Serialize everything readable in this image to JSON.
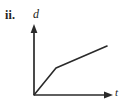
{
  "figure": {
    "item_number": "ii.",
    "background_color": "#ffffff",
    "stroke_color": "#2a2a2a",
    "width": 125,
    "height": 107
  },
  "chart_data": {
    "type": "line",
    "title": "",
    "subtitle": "",
    "xlabel": "t",
    "ylabel": "d",
    "xlabel_full": "time",
    "ylabel_full": "distance",
    "axes_style": "arrow-headed, no tick marks, no numeric scale",
    "grid": false,
    "legend": null,
    "xlim": [
      0,
      1
    ],
    "ylim": [
      0,
      1
    ],
    "tick_labels_x": [],
    "tick_labels_y": [],
    "annotations": [],
    "series": [
      {
        "name": "distance",
        "description": "piecewise-linear: steep constant-speed segment followed by a slower constant-speed segment",
        "x": [
          0,
          0.29,
          0.96
        ],
        "y": [
          0,
          0.39,
          0.7
        ],
        "pixel_points": [
          {
            "x": 34,
            "y": 95
          },
          {
            "x": 56,
            "y": 68
          },
          {
            "x": 107,
            "y": 46
          }
        ],
        "color": "#2a2a2a",
        "line_width": 1.6
      }
    ],
    "axis_geometry": {
      "origin": {
        "x": 34,
        "y": 95
      },
      "y_axis_top": {
        "x": 34,
        "y": 25
      },
      "x_axis_right": {
        "x": 112,
        "y": 95
      }
    }
  }
}
